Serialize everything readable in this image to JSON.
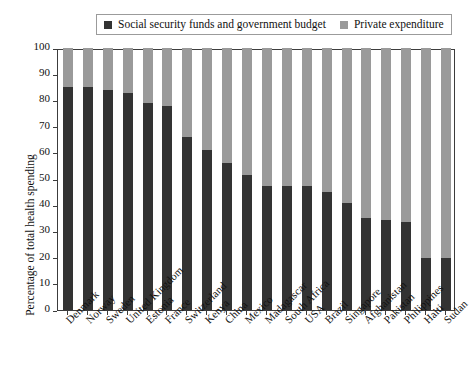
{
  "chart_data": {
    "type": "bar",
    "stacked": true,
    "title": "",
    "subtitle": "",
    "xlabel": "",
    "ylabel": "Percentage of total health spending",
    "ylim": [
      0,
      100
    ],
    "yticks": [
      0,
      10,
      20,
      30,
      40,
      50,
      60,
      70,
      80,
      90,
      100
    ],
    "ytick_labels": [
      "0",
      "10",
      "20",
      "30",
      "40",
      "50",
      "60",
      "70",
      "80",
      "90",
      "100"
    ],
    "grid": false,
    "legend_position": "top",
    "categories": [
      "Denmark",
      "Norway",
      "Sweden",
      "United Kingdom",
      "Estonia",
      "France",
      "Switzerland",
      "Kenya",
      "China",
      "Mexico",
      "Madagascar",
      "South Africa",
      "USA",
      "Brazil",
      "Singapore",
      "Afghanistan",
      "Pakistan",
      "Philippines",
      "Haiti",
      "Sudan"
    ],
    "series": [
      {
        "name": "Social security funds and government budget",
        "color": "#333333",
        "values": [
          85,
          85,
          84,
          83,
          79,
          78,
          66,
          61,
          56,
          51.5,
          47.5,
          47.5,
          47.5,
          45,
          41,
          35,
          34.5,
          33.5,
          20,
          20
        ]
      },
      {
        "name": "Private expenditure",
        "color": "#9a9a9a",
        "values": [
          15,
          15,
          16,
          17,
          21,
          22,
          34,
          39,
          44,
          48.5,
          52.5,
          52.5,
          52.5,
          55,
          59,
          65,
          65.5,
          66.5,
          80,
          80
        ]
      }
    ]
  },
  "legend": {
    "entries": [
      {
        "label": "Social security funds and government budget",
        "color": "#333333",
        "swatch_name": "legend-swatch-government"
      },
      {
        "label": "Private expenditure",
        "color": "#9a9a9a",
        "swatch_name": "legend-swatch-private"
      }
    ]
  }
}
